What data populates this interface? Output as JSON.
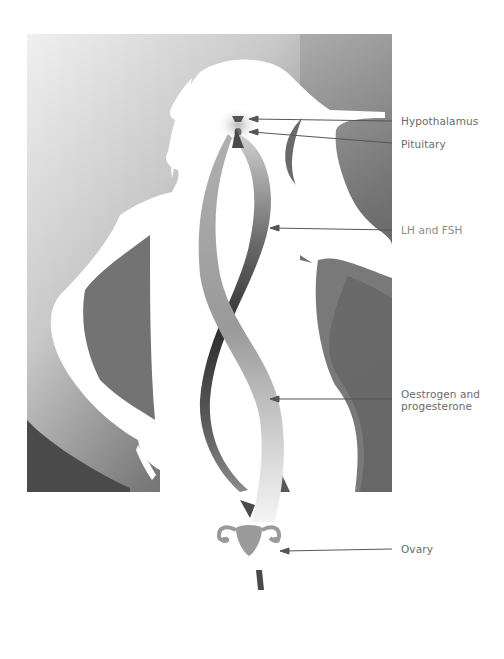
{
  "diagram": {
    "colors": {
      "background_light": "#eeeeee",
      "background_dark": "#4a4a4a",
      "silhouette": "#ffffff",
      "label_text": "#6a6a6a",
      "arrow_line": "#555555",
      "ribbon_dark": "#3a3a3a",
      "ribbon_light": "#a8a8a8",
      "organ_gray": "#9a9a9a"
    },
    "labels": [
      {
        "id": "hypothalamus",
        "text": "Hypothalamus"
      },
      {
        "id": "pituitary",
        "text": "Pituitary"
      },
      {
        "id": "lh_fsh",
        "text": "LH and FSH"
      },
      {
        "id": "oestrogen_progesterone_line1",
        "text": "Oestrogen and"
      },
      {
        "id": "oestrogen_progesterone_line2",
        "text": "progesterone"
      },
      {
        "id": "ovary",
        "text": "Ovary"
      }
    ]
  }
}
